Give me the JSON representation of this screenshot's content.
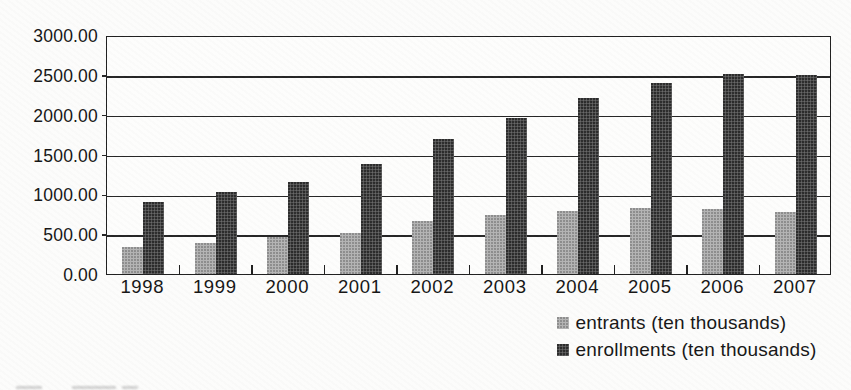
{
  "figure": {
    "title": "",
    "background": "#fcfcfb"
  },
  "chart_data": {
    "type": "bar",
    "title": "",
    "xlabel": "",
    "ylabel": "",
    "categories": [
      "1998",
      "1999",
      "2000",
      "2001",
      "2002",
      "2003",
      "2004",
      "2005",
      "2006",
      "2007"
    ],
    "series": [
      {
        "name": "entrants (ten thousands)",
        "color": "#b4b4b4",
        "values": [
          340,
          390,
          460,
          510,
          660,
          740,
          790,
          830,
          820,
          780
        ]
      },
      {
        "name": "enrollments (ten thousands)",
        "color": "#4e4e4e",
        "values": [
          900,
          1030,
          1160,
          1380,
          1700,
          1960,
          2210,
          2400,
          2510,
          2500
        ]
      }
    ],
    "ylim": [
      0,
      3000
    ],
    "ytick_step": 500,
    "ytick_labels": [
      "3000.00",
      "2500.00",
      "2000.00",
      "1500.00",
      "1000.00",
      "500.00",
      "0.00"
    ],
    "grid": "horizontal",
    "legend_position": "bottom-right",
    "axis_color": "#1f1f1f",
    "text_color": "#151515"
  }
}
